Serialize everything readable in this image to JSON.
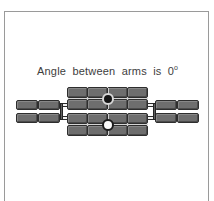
{
  "figure": {
    "caption_text": "Angle between arms is 0",
    "caption_degree": "o",
    "angle_value": 0,
    "angle_unit": "degrees"
  },
  "colors": {
    "block_fill": "#6e6e6e",
    "block_stroke": "#2e2e2e",
    "frame_border": "#9a9a9a",
    "background": "#ffffff",
    "caption_text": "#3d3d3d",
    "pivot_filled": "#141414",
    "pivot_hollow": "#fbfbfb"
  },
  "diagram": {
    "type": "mechanism-schematic",
    "left_arm": {
      "label": "left-arm",
      "rows": 2,
      "columns": 2,
      "blocks": [
        {
          "x": 11,
          "y": 88,
          "w": 22,
          "h": 10
        },
        {
          "x": 34,
          "y": 88,
          "w": 22,
          "h": 10
        },
        {
          "x": 11,
          "y": 101,
          "w": 22,
          "h": 10
        },
        {
          "x": 34,
          "y": 101,
          "w": 22,
          "h": 10
        }
      ]
    },
    "right_arm": {
      "label": "right-arm",
      "rows": 2,
      "columns": 2,
      "blocks": [
        {
          "x": 149,
          "y": 88,
          "w": 22,
          "h": 10
        },
        {
          "x": 172,
          "y": 88,
          "w": 22,
          "h": 10
        },
        {
          "x": 149,
          "y": 101,
          "w": 22,
          "h": 10
        },
        {
          "x": 172,
          "y": 101,
          "w": 22,
          "h": 10
        }
      ]
    },
    "upper_module": {
      "label": "upper-central-module",
      "rows": 2,
      "columns": 4,
      "x": 62,
      "y": 75,
      "w": 82,
      "h": 23,
      "pivot": {
        "cx": 103,
        "cy": 87,
        "r": 6,
        "style": "filled"
      }
    },
    "lower_module": {
      "label": "lower-central-module",
      "rows": 2,
      "columns": 4,
      "x": 62,
      "y": 101,
      "w": 82,
      "h": 23,
      "pivot": {
        "cx": 103,
        "cy": 113,
        "r": 6,
        "style": "hollow"
      }
    },
    "connectors": [
      {
        "label": "left-connector-upper",
        "x": 56,
        "y": 92,
        "w": 8,
        "h": 3
      },
      {
        "label": "left-connector-lower",
        "x": 56,
        "y": 104,
        "w": 8,
        "h": 3
      },
      {
        "label": "right-connector-upper",
        "x": 142,
        "y": 92,
        "w": 8,
        "h": 3
      },
      {
        "label": "right-connector-lower",
        "x": 142,
        "y": 104,
        "w": 8,
        "h": 3
      }
    ]
  }
}
